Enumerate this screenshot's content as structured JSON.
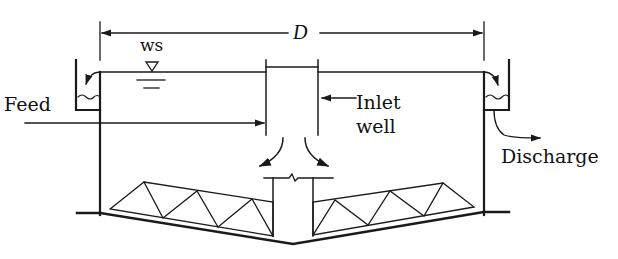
{
  "diagram": {
    "labels": {
      "diameter": "D",
      "water_surface": "ws",
      "feed": "Feed",
      "inlet_line1": "Inlet",
      "inlet_line2": "well",
      "discharge": "Discharge"
    },
    "components": [
      "tank-wall-left",
      "tank-wall-right",
      "effluent-launder-left",
      "effluent-launder-right",
      "inlet-well",
      "center-column",
      "sludge-scraper-truss-left",
      "sludge-scraper-truss-right",
      "sloped-floor",
      "water-surface-symbol",
      "diameter-dimension-line"
    ],
    "colors": {
      "line": "#1a1a1a",
      "background": "#ffffff"
    }
  }
}
